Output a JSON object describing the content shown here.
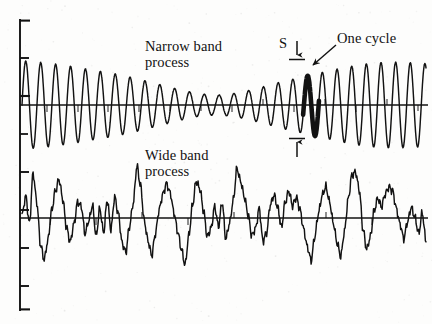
{
  "figure": {
    "background_color": "#fdfdfc",
    "ink_color": "#121212",
    "width": 432,
    "height": 324
  },
  "labels": {
    "narrow_band_line1": "Narrow band",
    "narrow_band_line2": "process",
    "wide_band_line1": "Wide band",
    "wide_band_line2": "process",
    "amplitude_symbol": "S",
    "one_cycle": "One cycle"
  },
  "axis": {
    "orientation": "vertical-left",
    "x": 20,
    "y_top": 20,
    "y_bottom": 310,
    "tick_length": 9,
    "tick_positions": [
      20,
      58,
      96,
      134,
      172,
      210,
      248,
      286,
      310
    ],
    "bracket_serifs": [
      "top",
      "bottom"
    ]
  },
  "annotations": {
    "s_dimension": {
      "label": "S",
      "kind": "double-headed-vertical-arrow",
      "x": 297,
      "top_y": 50,
      "bottom_y": 148,
      "meaning": "peak-to-trough amplitude of one cycle"
    },
    "one_cycle_callout": {
      "label": "One cycle",
      "kind": "leader-arrow",
      "from_x": 334,
      "from_y": 47,
      "to_x": 312,
      "to_y": 66
    },
    "bold_cycle": {
      "highlighted": true,
      "x_start": 303,
      "x_end": 319,
      "description": "one full period of the narrow band process drawn with heavy stroke"
    }
  },
  "chart_data": {
    "type": "line",
    "title": "",
    "xlabel": "",
    "ylabel": "",
    "grid": false,
    "legend": "none",
    "axis_style": "left vertical bracket with tick marks, horizontal zero line per trace",
    "series": [
      {
        "name": "Narrow band process",
        "zero_line_y": 105,
        "x_start": 22,
        "x_end": 426,
        "amplitude_scale": 46,
        "description": "Sinusoid of nearly constant frequency whose envelope beats: large at left, node near middle, large again at right",
        "carrier_cycles": 27,
        "envelope_points": [
          [
            0.0,
            0.96
          ],
          [
            0.04,
            0.93
          ],
          [
            0.08,
            0.89
          ],
          [
            0.12,
            0.84
          ],
          [
            0.16,
            0.78
          ],
          [
            0.2,
            0.72
          ],
          [
            0.24,
            0.66
          ],
          [
            0.28,
            0.58
          ],
          [
            0.32,
            0.49
          ],
          [
            0.36,
            0.4
          ],
          [
            0.4,
            0.31
          ],
          [
            0.44,
            0.24
          ],
          [
            0.48,
            0.21
          ],
          [
            0.52,
            0.24
          ],
          [
            0.56,
            0.31
          ],
          [
            0.6,
            0.4
          ],
          [
            0.64,
            0.5
          ],
          [
            0.68,
            0.58
          ],
          [
            0.72,
            0.66
          ],
          [
            0.76,
            0.74
          ],
          [
            0.8,
            0.82
          ],
          [
            0.84,
            0.88
          ],
          [
            0.88,
            0.92
          ],
          [
            0.92,
            0.93
          ],
          [
            0.96,
            0.92
          ],
          [
            1.0,
            0.9
          ]
        ]
      },
      {
        "name": "Wide band process",
        "zero_line_y": 218,
        "x_start": 22,
        "x_end": 426,
        "amplitude_scale": 52,
        "description": "Irregular broadband random signal: low-frequency excursions with superimposed high-frequency jitter, sharp isolated peaks",
        "values": [
          0.05,
          0.42,
          -0.1,
          0.86,
          0.3,
          -0.52,
          -0.8,
          -0.42,
          0.14,
          0.52,
          0.74,
          0.36,
          -0.18,
          -0.46,
          -0.12,
          0.3,
          0.22,
          -0.3,
          -0.06,
          0.24,
          -0.34,
          0.18,
          -0.28,
          0.34,
          -0.22,
          0.4,
          0.08,
          -0.48,
          -0.66,
          -0.16,
          0.28,
          1.0,
          0.62,
          -0.06,
          -0.44,
          -0.72,
          -0.3,
          0.16,
          0.46,
          0.66,
          0.48,
          0.1,
          -0.26,
          -0.6,
          -0.9,
          -0.34,
          0.24,
          0.7,
          0.56,
          0.12,
          -0.36,
          -0.2,
          0.22,
          -0.16,
          0.3,
          -0.4,
          -0.1,
          0.34,
          0.96,
          0.7,
          0.4,
          0.06,
          -0.34,
          -0.2,
          0.18,
          -0.44,
          -0.28,
          0.26,
          0.44,
          0.2,
          -0.18,
          0.3,
          0.52,
          0.24,
          0.4,
          0.16,
          -0.22,
          -0.56,
          -0.82,
          -0.36,
          0.1,
          0.44,
          0.6,
          0.3,
          -0.1,
          -0.48,
          -0.74,
          -0.26,
          0.36,
          0.82,
          0.88,
          0.54,
          -0.22,
          -0.6,
          -0.36,
          0.14,
          0.38,
          0.22,
          0.46,
          0.6,
          0.52,
          0.18,
          -0.12,
          -0.4,
          -0.08,
          0.2,
          0.02,
          -0.3,
          0.1,
          -0.46
        ]
      }
    ]
  }
}
